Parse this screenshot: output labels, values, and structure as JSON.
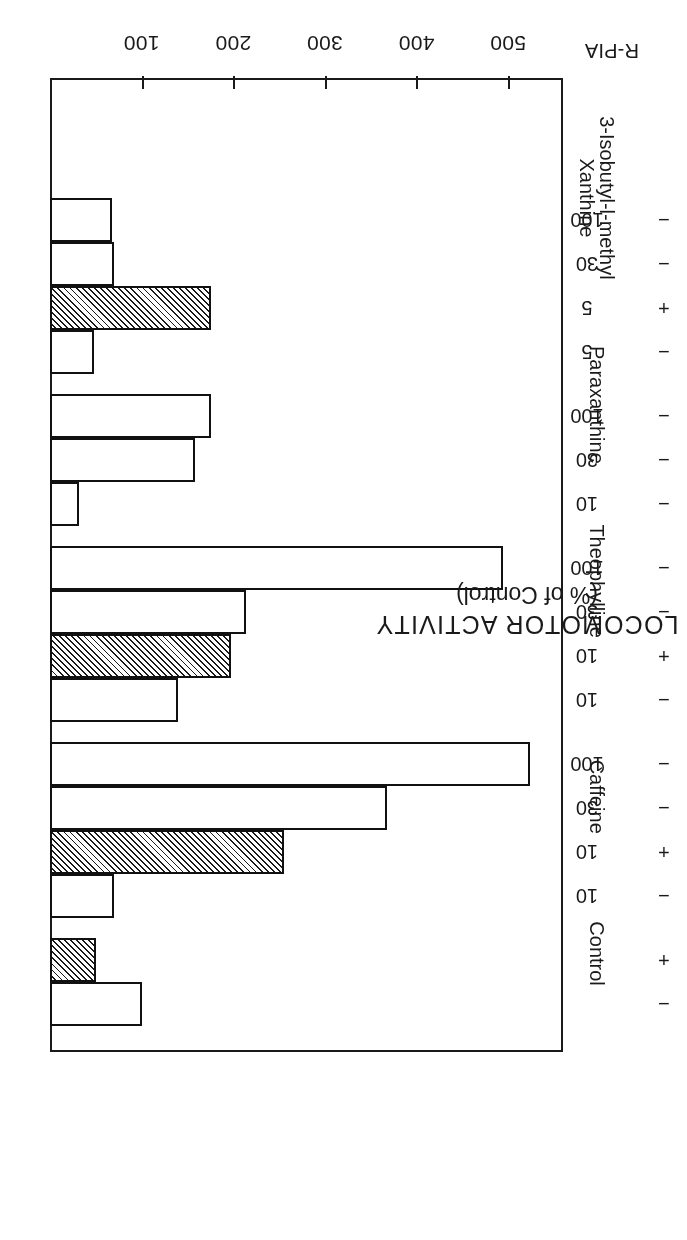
{
  "figure": {
    "orientation_note": "printed upside-down",
    "axis_title_line1": "LOCOMOTOR ACTIVITY",
    "axis_title_line2": "(% of Control)",
    "rpia_row_caption": "R-PIA"
  },
  "chart_data": {
    "type": "bar",
    "title": "LOCOMOTOR ACTIVITY (% of Control)",
    "xlabel": "LOCOMOTOR ACTIVITY (% of Control)",
    "ylabel": "",
    "orientation": "horizontal",
    "xlim": [
      0,
      560
    ],
    "ticks": [
      100,
      200,
      300,
      400,
      500
    ],
    "tick_labels": [
      "100",
      "200",
      "300",
      "400",
      "500"
    ],
    "grid": false,
    "legend": "none",
    "baseline": 0,
    "rpia_marks": [
      "−",
      "+"
    ],
    "groups": [
      {
        "name": "Control",
        "name_lines": [
          "Control"
        ],
        "bars": [
          {
            "dose": "",
            "rpia": "−",
            "value": 100,
            "hatched": false
          },
          {
            "dose": "",
            "rpia": "+",
            "value": 50,
            "hatched": true
          }
        ]
      },
      {
        "name": "Caffeine",
        "name_lines": [
          "Caffeine"
        ],
        "bars": [
          {
            "dose": "10",
            "rpia": "−",
            "value": 70,
            "hatched": false
          },
          {
            "dose": "10",
            "rpia": "+",
            "value": 255,
            "hatched": true
          },
          {
            "dose": "30",
            "rpia": "−",
            "value": 368,
            "hatched": false
          },
          {
            "dose": "100",
            "rpia": "−",
            "value": 524,
            "hatched": false
          }
        ]
      },
      {
        "name": "Theophylline",
        "name_lines": [
          "Theophylline"
        ],
        "bars": [
          {
            "dose": "10",
            "rpia": "−",
            "value": 140,
            "hatched": false
          },
          {
            "dose": "10",
            "rpia": "+",
            "value": 198,
            "hatched": true
          },
          {
            "dose": "30",
            "rpia": "−",
            "value": 214,
            "hatched": false
          },
          {
            "dose": "100",
            "rpia": "−",
            "value": 494,
            "hatched": false
          }
        ]
      },
      {
        "name": "Paraxanthine",
        "name_lines": [
          "Paraxanthine"
        ],
        "bars": [
          {
            "dose": "10",
            "rpia": "−",
            "value": 32,
            "hatched": false
          },
          {
            "dose": "30",
            "rpia": "−",
            "value": 158,
            "hatched": false
          },
          {
            "dose": "100",
            "rpia": "−",
            "value": 176,
            "hatched": false
          }
        ]
      },
      {
        "name": "3-Isobutyl-l-methyl Xanthine",
        "name_lines": [
          "3-Isobutyl-l-methyl",
          "Xanthine"
        ],
        "bars": [
          {
            "dose": "5",
            "rpia": "−",
            "value": 48,
            "hatched": false
          },
          {
            "dose": "5",
            "rpia": "+",
            "value": 176,
            "hatched": true
          },
          {
            "dose": "30",
            "rpia": "−",
            "value": 70,
            "hatched": false
          },
          {
            "dose": "100",
            "rpia": "−",
            "value": 68,
            "hatched": false
          }
        ]
      }
    ]
  }
}
